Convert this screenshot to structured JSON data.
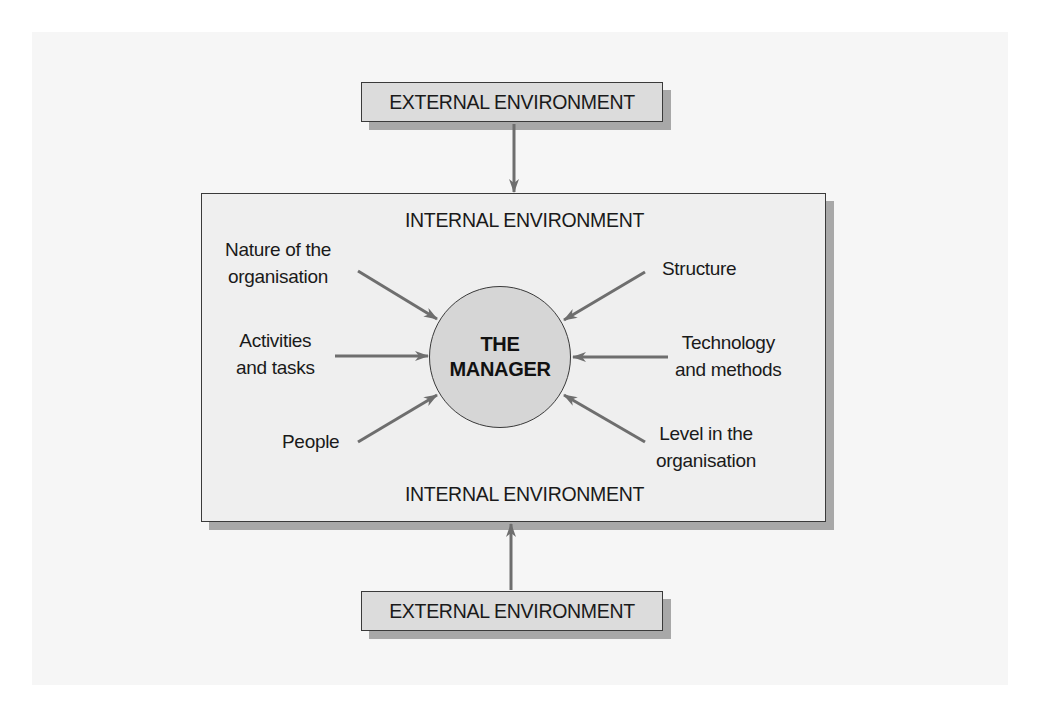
{
  "diagram": {
    "external_top": "EXTERNAL ENVIRONMENT",
    "external_bottom": "EXTERNAL ENVIRONMENT",
    "internal_top": "INTERNAL ENVIRONMENT",
    "internal_bottom": "INTERNAL ENVIRONMENT",
    "center": {
      "line1": "THE",
      "line2": "MANAGER"
    },
    "factors_left": [
      {
        "line1": "Nature of the",
        "line2": "organisation"
      },
      {
        "line1": "Activities",
        "line2": "and tasks"
      },
      {
        "line1": "People",
        "line2": ""
      }
    ],
    "factors_right": [
      {
        "line1": "Structure",
        "line2": ""
      },
      {
        "line1": "Technology",
        "line2": "and methods"
      },
      {
        "line1": "Level in the",
        "line2": "organisation"
      }
    ],
    "colors": {
      "arrow": "#6e6e6e",
      "box_fill": "#dcdcdc",
      "panel_fill": "#efefef",
      "circle_fill": "#d6d6d6",
      "shadow": "#a8a8a8",
      "border": "#3a3a3a"
    }
  }
}
